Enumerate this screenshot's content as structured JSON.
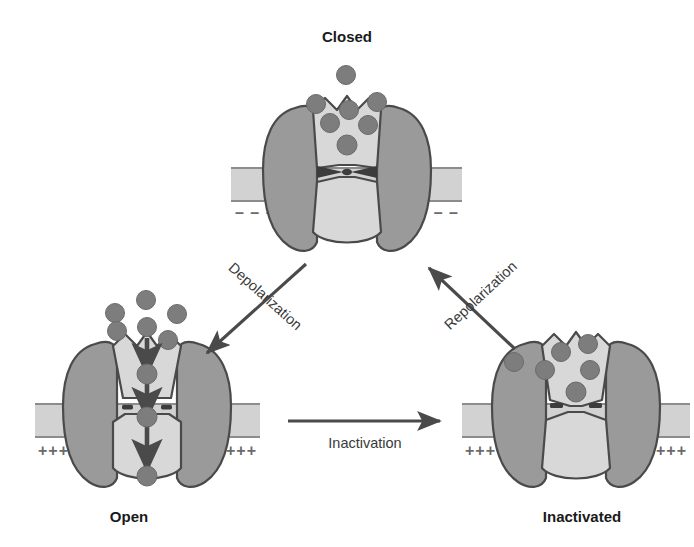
{
  "figure": {
    "background_color": "#ffffff"
  },
  "colors": {
    "protein_outer": "#9a9a9a",
    "protein_inner": "#d8d8d8",
    "protein_stroke": "#4a4a4a",
    "membrane_fill": "#d2d2d2",
    "membrane_stroke": "#8c8c8c",
    "ion_fill": "#7d7d7d",
    "ion_stroke": "#6a6a6a",
    "arrow": "#4a4a4a",
    "text": "#1a1a1a",
    "charge": "#6b6b6b"
  },
  "states": {
    "closed": {
      "label": "Closed",
      "gate_state": "closed",
      "membrane_charge": "negative",
      "charge_symbol": "–",
      "charge_left": "– – – –",
      "charge_right": "– – – –",
      "ions_above": 6,
      "ions_in_vestibule": 1,
      "ion_flow": false
    },
    "open": {
      "label": "Open",
      "gate_state": "open",
      "membrane_charge": "positive",
      "charge_symbol": "+",
      "charge_left": "++++",
      "charge_right": "++++",
      "ions_above": 6,
      "ions_in_pore": 3,
      "ions_below": 1,
      "ion_flow": true
    },
    "inactivated": {
      "label": "Inactivated",
      "gate_state": "inactivated",
      "membrane_charge": "positive",
      "charge_symbol": "+",
      "charge_left": "++++",
      "charge_right": "++++",
      "ions_above": 5,
      "ions_in_vestibule": 1,
      "ion_flow": false
    }
  },
  "transitions": {
    "depolarization": {
      "label": "Depolarization",
      "from": "closed",
      "to": "open",
      "direction": "down-left"
    },
    "repolarization": {
      "label": "Repolarization",
      "from": "inactivated",
      "to": "closed",
      "direction": "up-left"
    },
    "inactivation": {
      "label": "Inactivation",
      "from": "open",
      "to": "inactivated",
      "direction": "right"
    }
  }
}
